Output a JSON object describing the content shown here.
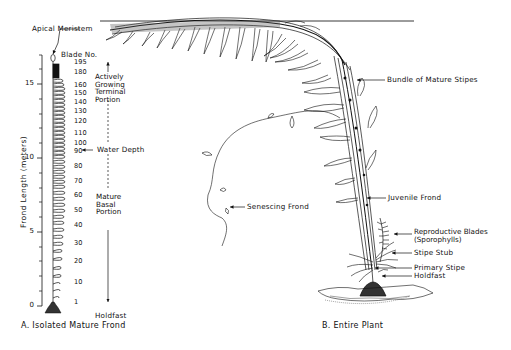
{
  "figure": {
    "panel_a": {
      "caption": "A. Isolated Mature Frond",
      "axis_title": "Frond Length (meters)",
      "axis_ticks": [
        "0",
        "5",
        "10",
        "15"
      ],
      "blade_header": "Blade No.",
      "blade_numbers": [
        "195",
        "180",
        "160",
        "150",
        "140",
        "130",
        "120",
        "110",
        "100",
        "90",
        "80",
        "70",
        "60",
        "50",
        "40",
        "30",
        "20",
        "10",
        "1"
      ],
      "labels": {
        "apical_meristem": "Apical Meristem",
        "water_depth": "Water Depth",
        "holdfast": "Holdfast",
        "growing_line1": "Actively",
        "growing_line2": "Growing",
        "growing_line3": "Terminal",
        "growing_line4": "Portion",
        "basal_line1": "Mature",
        "basal_line2": "Basal",
        "basal_line3": "Portion"
      }
    },
    "panel_b": {
      "caption": "B. Entire Plant",
      "labels": {
        "bundle": "Bundle of Mature Stipes",
        "senescing": "Senescing Frond",
        "juvenile": "Juvenile Frond",
        "repro_line1": "Reproductive Blades",
        "repro_line2": "(Sporophylls)",
        "stipe_stub": "Stipe Stub",
        "primary_stipe": "Primary Stipe",
        "holdfast": "Holdfast"
      }
    },
    "colors": {
      "ink": "#111111",
      "background": "#ffffff"
    }
  }
}
